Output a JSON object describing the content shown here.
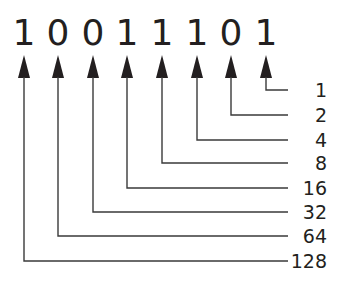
{
  "diagram": {
    "type": "binary-place-value",
    "binary_string": "10011101",
    "bits": [
      {
        "digit": "1",
        "place_value": "128"
      },
      {
        "digit": "0",
        "place_value": "64"
      },
      {
        "digit": "0",
        "place_value": "32"
      },
      {
        "digit": "1",
        "place_value": "16"
      },
      {
        "digit": "1",
        "place_value": "8"
      },
      {
        "digit": "1",
        "place_value": "4"
      },
      {
        "digit": "0",
        "place_value": "2"
      },
      {
        "digit": "1",
        "place_value": "1"
      }
    ],
    "labels_top_to_bottom": [
      "1",
      "2",
      "4",
      "8",
      "16",
      "32",
      "64",
      "128"
    ],
    "colors": {
      "text": "#231f20",
      "lines": "#3a3a3a",
      "background": "#ffffff"
    }
  }
}
